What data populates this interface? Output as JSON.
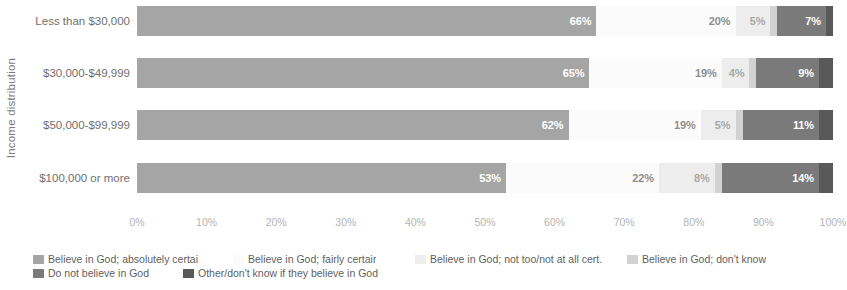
{
  "chart_data": {
    "type": "bar",
    "subtype": "stacked-horizontal-100pct",
    "title": "",
    "xlabel": "",
    "ylabel": "Income distribution",
    "xlim": [
      0,
      100
    ],
    "xticks": [
      "0%",
      "10%",
      "20%",
      "30%",
      "40%",
      "50%",
      "60%",
      "70%",
      "80%",
      "90%",
      "100%"
    ],
    "grid": false,
    "legend_position": "bottom-left",
    "categories": [
      "Less than $30,000",
      "$30,000-$49,999",
      "$50,000-$99,999",
      "$100,000 or more"
    ],
    "series": [
      {
        "name": "Believe in God; absolutely certai",
        "color": "#a5a5a5",
        "values": [
          66,
          65,
          62,
          53
        ],
        "labels": [
          "66%",
          "65%",
          "62%",
          "53%"
        ]
      },
      {
        "name": "Believe in God; fairly certair",
        "color": "#fbfbfb",
        "values": [
          20,
          19,
          19,
          22
        ],
        "labels": [
          "20%",
          "19%",
          "19%",
          "22%"
        ]
      },
      {
        "name": "Believe in God; not too/not at all cert.",
        "color": "#ededed",
        "values": [
          5,
          4,
          5,
          8
        ],
        "labels": [
          "5%",
          "4%",
          "5%",
          "8%"
        ]
      },
      {
        "name": "Believe in God; don't know",
        "color": "#d2d2d2",
        "values": [
          1,
          1,
          1,
          1
        ],
        "labels": [
          "",
          "",
          "",
          ""
        ]
      },
      {
        "name": "Do not believe in God",
        "color": "#7a7a7a",
        "values": [
          7,
          9,
          11,
          14
        ],
        "labels": [
          "7%",
          "9%",
          "11%",
          "14%"
        ]
      },
      {
        "name": "Other/don't know if they believe in God",
        "color": "#595959",
        "values": [
          1,
          2,
          2,
          2
        ],
        "labels": [
          "",
          "",
          "",
          ""
        ]
      }
    ]
  },
  "legend": {
    "row1": [
      "Believe in God; absolutely certai",
      "Believe in God; fairly certair",
      "Believe in God; not too/not at all cert.",
      "Believe in God; don't know"
    ],
    "row2": [
      "Do not believe in God",
      "Other/don't know if they believe in God"
    ]
  }
}
